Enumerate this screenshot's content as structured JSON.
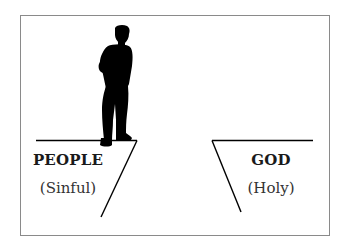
{
  "diagram": {
    "type": "chasm-illustration",
    "left_side": {
      "title": "PEOPLE",
      "subtitle": "(Sinful)",
      "figure": "standing-man-silhouette"
    },
    "right_side": {
      "title": "GOD",
      "subtitle": "(Holy)"
    },
    "colors": {
      "ink": "#000000",
      "frame_border": "#8a8a8a",
      "background": "#ffffff"
    }
  }
}
